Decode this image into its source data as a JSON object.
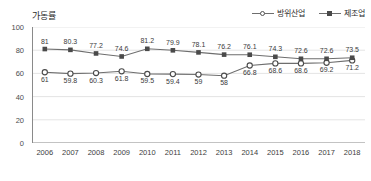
{
  "chart_data": {
    "type": "line",
    "title": "가동률",
    "xlabel": "",
    "ylabel": "",
    "categories": [
      "2006",
      "2007",
      "2008",
      "2009",
      "2010",
      "2011",
      "2012",
      "2013",
      "2014",
      "2015",
      "2016",
      "2017",
      "2018"
    ],
    "ylim": [
      0,
      100
    ],
    "yticks": [
      0,
      20,
      40,
      60,
      80,
      100
    ],
    "grid": true,
    "legend_position": "top-right",
    "series": [
      {
        "name": "방위산업",
        "marker": "open-circle",
        "color": "#6e6e6e",
        "label_position": "below",
        "values": [
          61,
          59.8,
          60.3,
          61.8,
          59.5,
          59.4,
          59,
          58,
          66.8,
          68.6,
          68.6,
          69.2,
          71.2
        ],
        "labels": [
          "61",
          "59.8",
          "60.3",
          "61.8",
          "59.5",
          "59.4",
          "59",
          "58",
          "66.8",
          "68.6",
          "68.6",
          "69.2",
          "71.2"
        ]
      },
      {
        "name": "제조업",
        "marker": "filled-square",
        "color": "#6e6e6e",
        "label_position": "above",
        "values": [
          81,
          80.3,
          77.2,
          74.6,
          81.2,
          79.9,
          78.1,
          76.2,
          76.1,
          74.3,
          72.6,
          72.6,
          73.5
        ],
        "labels": [
          "81",
          "80.3",
          "77.2",
          "74.6",
          "81.2",
          "79.9",
          "78.1",
          "76.2",
          "76.1",
          "74.3",
          "72.6",
          "72.6",
          "73.5"
        ]
      }
    ]
  },
  "legend": {
    "items": [
      {
        "label": "방위산업"
      },
      {
        "label": "제조업"
      }
    ]
  },
  "axis": {
    "y_tick_labels": [
      "100",
      "80",
      "60",
      "40",
      "20",
      "0"
    ]
  }
}
